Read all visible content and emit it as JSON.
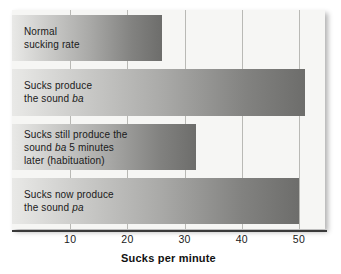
{
  "chart_data": {
    "type": "bar",
    "orientation": "horizontal",
    "title": "",
    "xlabel": "Sucks per minute",
    "ylabel": "",
    "xlim": [
      0,
      55
    ],
    "grid": true,
    "legend": null,
    "xticks": [
      "10",
      "20",
      "30",
      "40",
      "50"
    ],
    "xtick_values": [
      10,
      20,
      30,
      40,
      50
    ],
    "categories": [
      "Normal sucking rate",
      "Sucks produce the sound ba",
      "Sucks still produce the sound ba 5 minutes later (habituation)",
      "Sucks now produce the sound pa"
    ],
    "values": [
      26,
      51,
      32,
      50
    ],
    "bars": [
      {
        "value": 26,
        "label_lines": [
          "Normal",
          "sucking rate"
        ],
        "label_html": "Normal\nsucking rate"
      },
      {
        "value": 51,
        "label_lines": [
          "Sucks produce",
          "the sound ba"
        ],
        "label_html": "Sucks produce\nthe sound <i>ba</i>"
      },
      {
        "value": 32,
        "label_lines": [
          "Sucks still produce the",
          "sound ba 5 minutes",
          "later (habituation)"
        ],
        "label_html": "Sucks still produce the\nsound <i>ba</i> 5 minutes\nlater (habituation)"
      },
      {
        "value": 50,
        "label_lines": [
          "Sucks now produce",
          "the sound pa"
        ],
        "label_html": "Sucks now produce\nthe sound <i>pa</i>"
      }
    ],
    "colors": {
      "bar_gradient_start": "#e9e9e7",
      "bar_gradient_end": "#6d6d6b",
      "plot_background": "#f6f6f4",
      "gridline": "#b9b9b5",
      "axis_line": "#3a3a3a",
      "text": "#1a1a1a",
      "page_background": "#ffffff"
    }
  }
}
